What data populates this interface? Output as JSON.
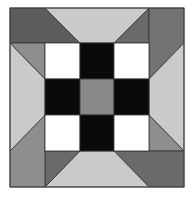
{
  "diagram": {
    "type": "quilt-block",
    "colors": {
      "dark": "#5c5c5c",
      "medium": "#8e8e8e",
      "light": "#cacaca",
      "black": "#0a0a0a",
      "white": "#ffffff",
      "center": "#8a8a8a",
      "seam": "#333333"
    },
    "grid": {
      "x": [
        10,
        45,
        80,
        114,
        149,
        184
      ],
      "y": [
        8,
        43,
        79,
        115,
        151,
        187
      ]
    }
  }
}
